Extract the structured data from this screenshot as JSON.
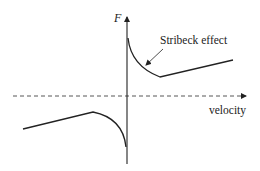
{
  "diagram": {
    "y_axis_label": "F",
    "x_axis_label": "velocity",
    "annotation": "Stribeck effect",
    "colors": {
      "curve": "#222222",
      "axis": "#222222",
      "background": "#ffffff"
    },
    "axes": {
      "x_axis_style": "dashed",
      "y_axis_style": "solid"
    }
  }
}
